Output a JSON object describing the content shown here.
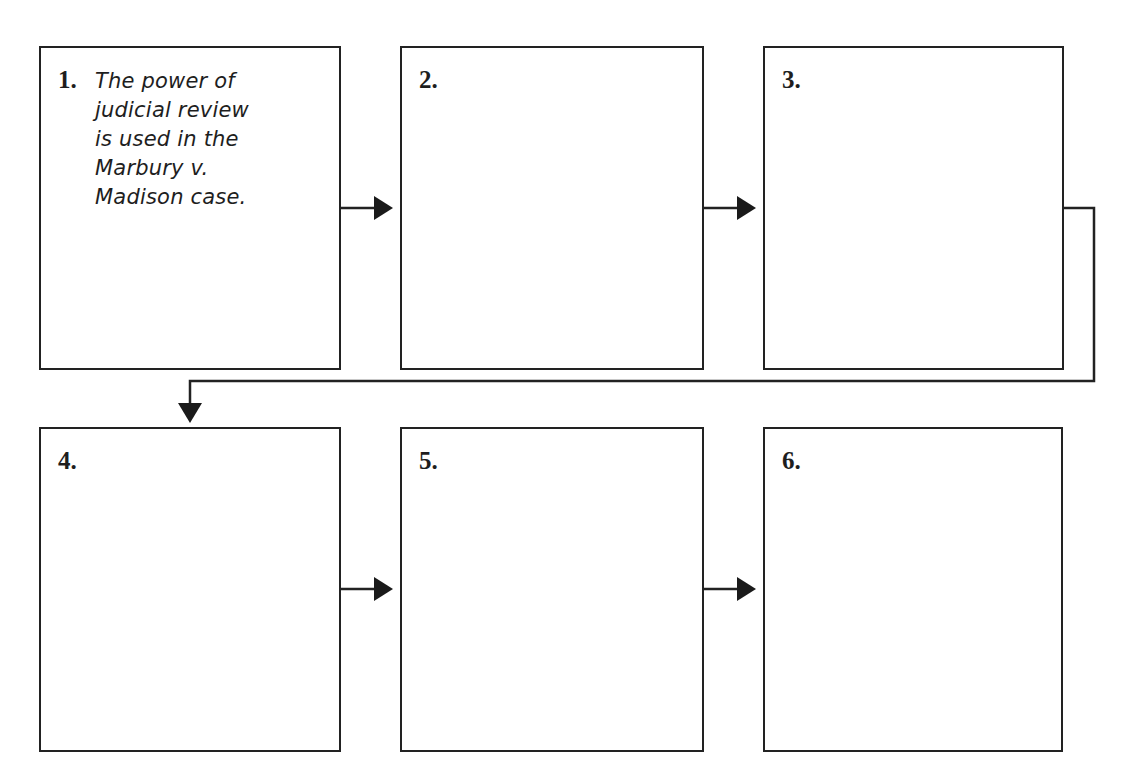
{
  "diagram": {
    "type": "flowchart-sequence",
    "boxes": [
      {
        "number": "1.",
        "text": "The power of\njudicial review\nis used in the\nMarbury v.\nMadison case."
      },
      {
        "number": "2.",
        "text": ""
      },
      {
        "number": "3.",
        "text": ""
      },
      {
        "number": "4.",
        "text": ""
      },
      {
        "number": "5.",
        "text": ""
      },
      {
        "number": "6.",
        "text": ""
      }
    ],
    "connections": [
      {
        "from": "1",
        "to": "2"
      },
      {
        "from": "2",
        "to": "3"
      },
      {
        "from": "3",
        "to": "4"
      },
      {
        "from": "4",
        "to": "5"
      },
      {
        "from": "5",
        "to": "6"
      }
    ],
    "colors": {
      "stroke": "#222222",
      "background": "#ffffff"
    }
  }
}
